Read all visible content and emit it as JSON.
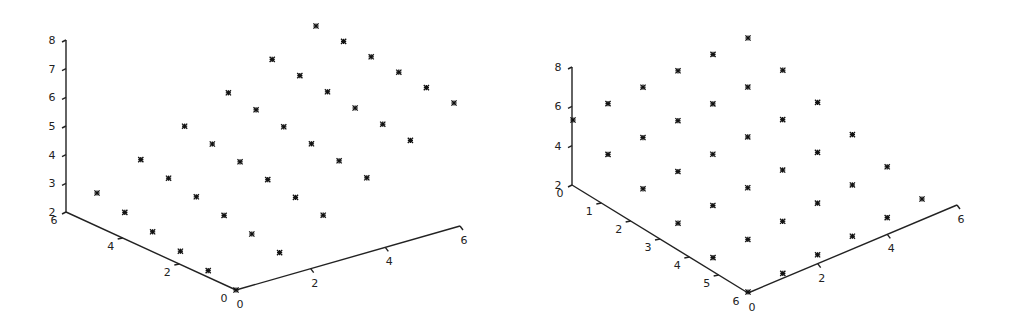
{
  "chart_data": [
    {
      "type": "scatter3d",
      "title": "",
      "marker": "asterisk",
      "grid": {
        "nx": 6,
        "ny": 6
      },
      "axes": {
        "z": {
          "ticks": [
            "2",
            "3",
            "4",
            "5",
            "6",
            "7",
            "8"
          ],
          "range": [
            2,
            8
          ]
        },
        "y": {
          "ticks": [
            "6",
            "4",
            "2",
            "0"
          ],
          "range": [
            0,
            6
          ]
        },
        "x": {
          "ticks": [
            "0",
            "2",
            "4",
            "6"
          ],
          "range": [
            0,
            6
          ]
        }
      },
      "geometry": {
        "z_axis": {
          "top": [
            66,
            40
          ],
          "bottom": [
            66,
            212
          ]
        },
        "y_axis": {
          "start": [
            66,
            212
          ],
          "end": [
            236,
            290
          ]
        },
        "x_axis": {
          "start": [
            236,
            290
          ],
          "end": [
            460,
            226
          ]
        },
        "point_corners": {
          "front": [
            236,
            290
          ],
          "left": [
            97,
            193
          ],
          "right": [
            454,
            103
          ],
          "top": [
            316,
            26
          ]
        }
      },
      "z_surface_estimate": {
        "front": 2.0,
        "left": 2.6,
        "right": 5.5,
        "top": 8.3
      }
    },
    {
      "type": "scatter3d",
      "title": "",
      "marker": "asterisk",
      "grid": {
        "nx": 6,
        "ny": 6
      },
      "axes": {
        "z": {
          "ticks": [
            "2",
            "4",
            "6",
            "8"
          ],
          "range": [
            2,
            8
          ]
        },
        "y": {
          "ticks": [
            "0",
            "1",
            "2",
            "3",
            "4",
            "5",
            "6"
          ],
          "range": [
            0,
            6
          ]
        },
        "x": {
          "ticks": [
            "0",
            "2",
            "4",
            "6"
          ],
          "range": [
            0,
            6
          ]
        }
      },
      "geometry": {
        "z_axis": {
          "top": [
            572,
            67
          ],
          "bottom": [
            572,
            185
          ]
        },
        "y_axis": {
          "start": [
            572,
            185
          ],
          "end": [
            748,
            293
          ]
        },
        "x_axis": {
          "start": [
            748,
            293
          ],
          "end": [
            957,
            205
          ]
        },
        "point_corners": {
          "front": [
            748,
            292
          ],
          "left": [
            573,
            120
          ],
          "right": [
            922,
            199
          ],
          "top": [
            748,
            38
          ]
        }
      },
      "z_surface_estimate": {
        "front": 2.0,
        "left": 5.2,
        "right": 2.0,
        "top": 8.2
      }
    }
  ]
}
